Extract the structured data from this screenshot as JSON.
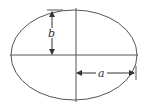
{
  "diagram": {
    "type": "ellipse-axes",
    "labels": {
      "semi_minor": "b",
      "semi_major": "a"
    },
    "colors": {
      "stroke": "#555555",
      "background": "#ffffff"
    }
  }
}
